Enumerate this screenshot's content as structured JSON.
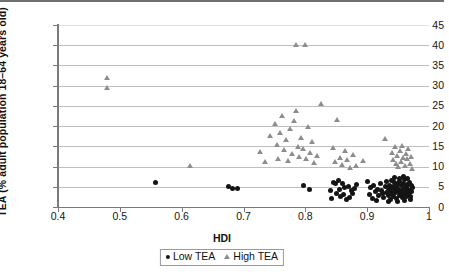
{
  "chart_data": {
    "type": "scatter",
    "title": "",
    "xlabel": "HDI",
    "ylabel": "TEA (% adult population 18–64 years old)",
    "xlim": [
      0.4,
      1.0
    ],
    "ylim": [
      0,
      45
    ],
    "xticks": [
      "0.4",
      "0.5",
      "0.6",
      "0.7",
      "0.8",
      "0.9",
      "1"
    ],
    "xtick_values": [
      0.4,
      0.5,
      0.6,
      0.7,
      0.8,
      0.9,
      1.0
    ],
    "yticks": [
      "0",
      "5",
      "10",
      "15",
      "20",
      "25",
      "30",
      "35",
      "40",
      "45"
    ],
    "ytick_values": [
      0,
      5,
      10,
      15,
      20,
      25,
      30,
      35,
      40,
      45
    ],
    "grid": "horizontal",
    "legend_position": "bottom-center",
    "legend": [
      {
        "name": "Low TEA",
        "marker": "circle",
        "color": "#141414"
      },
      {
        "name": "High TEA",
        "marker": "triangle",
        "color": "#8d8d8d"
      }
    ],
    "series": [
      {
        "name": "Low TEA",
        "marker": "circle",
        "color": "#141414",
        "points": [
          [
            0.558,
            6.1
          ],
          [
            0.676,
            5.0
          ],
          [
            0.683,
            4.6
          ],
          [
            0.69,
            4.6
          ],
          [
            0.797,
            5.3
          ],
          [
            0.806,
            4.3
          ],
          [
            0.841,
            4.1
          ],
          [
            0.843,
            2.2
          ],
          [
            0.845,
            6.1
          ],
          [
            0.848,
            5.9
          ],
          [
            0.851,
            3.3
          ],
          [
            0.853,
            6.5
          ],
          [
            0.856,
            4.4
          ],
          [
            0.857,
            2.6
          ],
          [
            0.86,
            5.8
          ],
          [
            0.862,
            3.0
          ],
          [
            0.864,
            4.8
          ],
          [
            0.866,
            1.9
          ],
          [
            0.869,
            5.1
          ],
          [
            0.871,
            2.4
          ],
          [
            0.874,
            4.0
          ],
          [
            0.877,
            3.4
          ],
          [
            0.88,
            4.6
          ],
          [
            0.883,
            5.5
          ],
          [
            0.901,
            6.4
          ],
          [
            0.903,
            3.1
          ],
          [
            0.906,
            4.7
          ],
          [
            0.908,
            2.2
          ],
          [
            0.911,
            5.2
          ],
          [
            0.913,
            3.8
          ],
          [
            0.915,
            1.7
          ],
          [
            0.917,
            4.3
          ],
          [
            0.919,
            2.9
          ],
          [
            0.921,
            5.9
          ],
          [
            0.923,
            4.1
          ],
          [
            0.925,
            3.3
          ],
          [
            0.927,
            2.4
          ],
          [
            0.929,
            5.0
          ],
          [
            0.931,
            6.2
          ],
          [
            0.932,
            3.6
          ],
          [
            0.934,
            4.5
          ],
          [
            0.935,
            2.8
          ],
          [
            0.936,
            5.4
          ],
          [
            0.937,
            3.9
          ],
          [
            0.938,
            1.9
          ],
          [
            0.939,
            4.8
          ],
          [
            0.94,
            6.6
          ],
          [
            0.941,
            3.2
          ],
          [
            0.942,
            5.1
          ],
          [
            0.943,
            2.5
          ],
          [
            0.944,
            4.2
          ],
          [
            0.945,
            6.0
          ],
          [
            0.946,
            3.5
          ],
          [
            0.947,
            4.9
          ],
          [
            0.948,
            2.1
          ],
          [
            0.949,
            5.6
          ],
          [
            0.95,
            3.8
          ],
          [
            0.951,
            4.4
          ],
          [
            0.952,
            2.9
          ],
          [
            0.953,
            6.3
          ],
          [
            0.954,
            3.4
          ],
          [
            0.955,
            5.2
          ],
          [
            0.956,
            4.0
          ],
          [
            0.957,
            2.3
          ],
          [
            0.958,
            5.8
          ],
          [
            0.959,
            3.1
          ],
          [
            0.96,
            4.6
          ],
          [
            0.961,
            6.8
          ],
          [
            0.962,
            3.7
          ],
          [
            0.963,
            5.0
          ],
          [
            0.964,
            2.7
          ],
          [
            0.965,
            4.3
          ],
          [
            0.966,
            5.5
          ],
          [
            0.967,
            3.3
          ],
          [
            0.968,
            6.1
          ],
          [
            0.969,
            4.1
          ],
          [
            0.97,
            2.6
          ],
          [
            0.971,
            5.3
          ],
          [
            0.972,
            3.9
          ],
          [
            0.973,
            4.7
          ],
          [
            0.944,
            7.4
          ],
          [
            0.952,
            7.1
          ],
          [
            0.958,
            7.6
          ],
          [
            0.966,
            7.0
          ],
          [
            0.935,
            1.4
          ],
          [
            0.949,
            1.3
          ],
          [
            0.96,
            1.6
          ],
          [
            0.97,
            1.8
          ]
        ]
      },
      {
        "name": "High TEA",
        "marker": "triangle",
        "color": "#8d8d8d",
        "points": [
          [
            0.48,
            32.0
          ],
          [
            0.48,
            29.4
          ],
          [
            0.614,
            10.2
          ],
          [
            0.727,
            13.6
          ],
          [
            0.735,
            11.1
          ],
          [
            0.744,
            17.6
          ],
          [
            0.751,
            20.5
          ],
          [
            0.754,
            15.4
          ],
          [
            0.757,
            12.0
          ],
          [
            0.76,
            18.3
          ],
          [
            0.763,
            22.6
          ],
          [
            0.766,
            14.2
          ],
          [
            0.77,
            16.6
          ],
          [
            0.773,
            11.5
          ],
          [
            0.776,
            19.4
          ],
          [
            0.779,
            13.1
          ],
          [
            0.782,
            21.2
          ],
          [
            0.785,
            40.0
          ],
          [
            0.786,
            23.7
          ],
          [
            0.788,
            15.0
          ],
          [
            0.791,
            12.4
          ],
          [
            0.794,
            17.1
          ],
          [
            0.797,
            14.4
          ],
          [
            0.8,
            40.0
          ],
          [
            0.802,
            11.8
          ],
          [
            0.805,
            19.9
          ],
          [
            0.808,
            13.4
          ],
          [
            0.811,
            16.0
          ],
          [
            0.815,
            10.9
          ],
          [
            0.82,
            12.7
          ],
          [
            0.826,
            25.5
          ],
          [
            0.845,
            14.6
          ],
          [
            0.849,
            11.3
          ],
          [
            0.852,
            21.5
          ],
          [
            0.856,
            12.2
          ],
          [
            0.86,
            10.4
          ],
          [
            0.864,
            14.0
          ],
          [
            0.868,
            11.7
          ],
          [
            0.872,
            9.6
          ],
          [
            0.877,
            12.9
          ],
          [
            0.882,
            10.1
          ],
          [
            0.893,
            11.4
          ],
          [
            0.93,
            16.8
          ],
          [
            0.94,
            13.4
          ],
          [
            0.943,
            11.6
          ],
          [
            0.945,
            14.8
          ],
          [
            0.947,
            10.7
          ],
          [
            0.949,
            12.6
          ],
          [
            0.951,
            9.9
          ],
          [
            0.953,
            13.8
          ],
          [
            0.955,
            11.2
          ],
          [
            0.957,
            15.2
          ],
          [
            0.959,
            12.1
          ],
          [
            0.961,
            10.3
          ],
          [
            0.963,
            13.1
          ],
          [
            0.965,
            11.9
          ],
          [
            0.967,
            14.3
          ],
          [
            0.969,
            10.8
          ],
          [
            0.971,
            12.4
          ],
          [
            0.973,
            9.4
          ]
        ]
      }
    ]
  }
}
